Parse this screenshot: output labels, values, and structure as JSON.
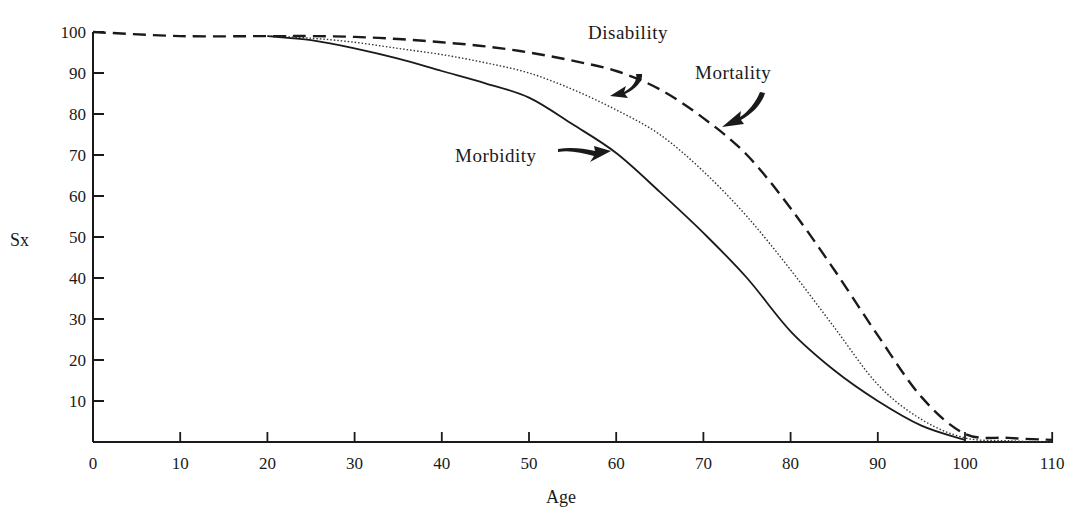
{
  "chart_data": {
    "type": "line",
    "title": "",
    "xlabel": "Age",
    "ylabel": "Sx",
    "xlim": [
      0,
      110
    ],
    "ylim": [
      0,
      100
    ],
    "x_ticks": [
      0,
      10,
      20,
      30,
      40,
      50,
      60,
      70,
      80,
      90,
      100,
      110
    ],
    "y_ticks": [
      10,
      20,
      30,
      40,
      50,
      60,
      70,
      80,
      90,
      100
    ],
    "grid": false,
    "legend": "none (curves labeled with arrow annotations)",
    "series": [
      {
        "name": "Morbidity",
        "style": "solid",
        "points": [
          [
            20,
            99
          ],
          [
            25,
            98
          ],
          [
            30,
            96
          ],
          [
            35,
            93.5
          ],
          [
            40,
            90.5
          ],
          [
            45,
            87.5
          ],
          [
            50,
            84
          ],
          [
            55,
            77.5
          ],
          [
            60,
            70.5
          ],
          [
            65,
            61
          ],
          [
            70,
            51
          ],
          [
            75,
            40
          ],
          [
            80,
            27
          ],
          [
            85,
            17.5
          ],
          [
            90,
            10
          ],
          [
            95,
            4
          ],
          [
            100,
            0.5
          ]
        ]
      },
      {
        "name": "Disability",
        "style": "dotted",
        "points": [
          [
            20,
            99
          ],
          [
            25,
            98.5
          ],
          [
            30,
            97.5
          ],
          [
            35,
            96
          ],
          [
            40,
            94.5
          ],
          [
            45,
            92.5
          ],
          [
            50,
            90
          ],
          [
            55,
            86
          ],
          [
            60,
            81
          ],
          [
            65,
            75
          ],
          [
            70,
            66
          ],
          [
            75,
            55
          ],
          [
            80,
            42
          ],
          [
            85,
            28
          ],
          [
            90,
            14
          ],
          [
            95,
            5.5
          ],
          [
            100,
            1
          ],
          [
            105,
            0.3
          ],
          [
            110,
            0
          ]
        ]
      },
      {
        "name": "Mortality",
        "style": "dashed",
        "points": [
          [
            0,
            100
          ],
          [
            10,
            99
          ],
          [
            20,
            99
          ],
          [
            25,
            99
          ],
          [
            30,
            98.8
          ],
          [
            35,
            98.3
          ],
          [
            40,
            97.5
          ],
          [
            45,
            96.5
          ],
          [
            50,
            95
          ],
          [
            55,
            93
          ],
          [
            60,
            90.5
          ],
          [
            65,
            86
          ],
          [
            70,
            79
          ],
          [
            75,
            70
          ],
          [
            80,
            57
          ],
          [
            85,
            42
          ],
          [
            90,
            26
          ],
          [
            95,
            11
          ],
          [
            100,
            2
          ],
          [
            105,
            1
          ],
          [
            110,
            0.5
          ]
        ]
      }
    ],
    "annotations": [
      {
        "text": "Disability",
        "arrow_to": [
          58,
          83
        ]
      },
      {
        "text": "Mortality",
        "arrow_to": [
          72,
          77
        ]
      },
      {
        "text": "Morbidity",
        "arrow_to": [
          60,
          70
        ]
      }
    ]
  },
  "labels": {
    "y_axis": "Sx",
    "x_axis": "Age",
    "disability": "Disability",
    "mortality": "Mortality",
    "morbidity": "Morbidity"
  },
  "ticks": {
    "x": [
      "0",
      "10",
      "20",
      "30",
      "40",
      "50",
      "60",
      "70",
      "80",
      "90",
      "100",
      "110"
    ],
    "y": [
      "10",
      "20",
      "30",
      "40",
      "50",
      "60",
      "70",
      "80",
      "90",
      "100"
    ]
  }
}
